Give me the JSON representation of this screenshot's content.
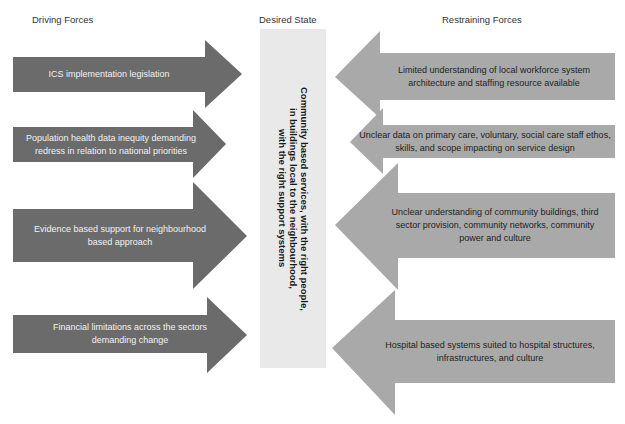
{
  "headings": {
    "driving": "Driving Forces",
    "desired": "Desired State",
    "restraining": "Restraining Forces"
  },
  "desired_state": {
    "text": "Community based services, with the right people,\nin buildings local to the neighbourhood,\nwith the right support systems"
  },
  "driving_forces": [
    {
      "label": "ICS implementation legislation"
    },
    {
      "label": "Population health data inequity demanding redress in relation to national priorities"
    },
    {
      "label": "Evidence based support for neighbourhood based approach"
    },
    {
      "label": "Financial limitations across the sectors demanding change"
    }
  ],
  "restraining_forces": [
    {
      "label": "Limited understanding of local workforce system architecture and staffing resource available"
    },
    {
      "label": "Unclear data on primary care, voluntary, social care staff ethos, skills, and scope impacting on service design"
    },
    {
      "label": "Unclear understanding of community buildings, third sector provision, community networks, community power and culture"
    },
    {
      "label": "Hospital based systems suited to hospital structures, infrastructures, and culture"
    }
  ],
  "colors": {
    "driving_arrow": "#6b6b6b",
    "restraining_arrow": "#a9a9a9",
    "desired_box": "#e9e9e9"
  }
}
